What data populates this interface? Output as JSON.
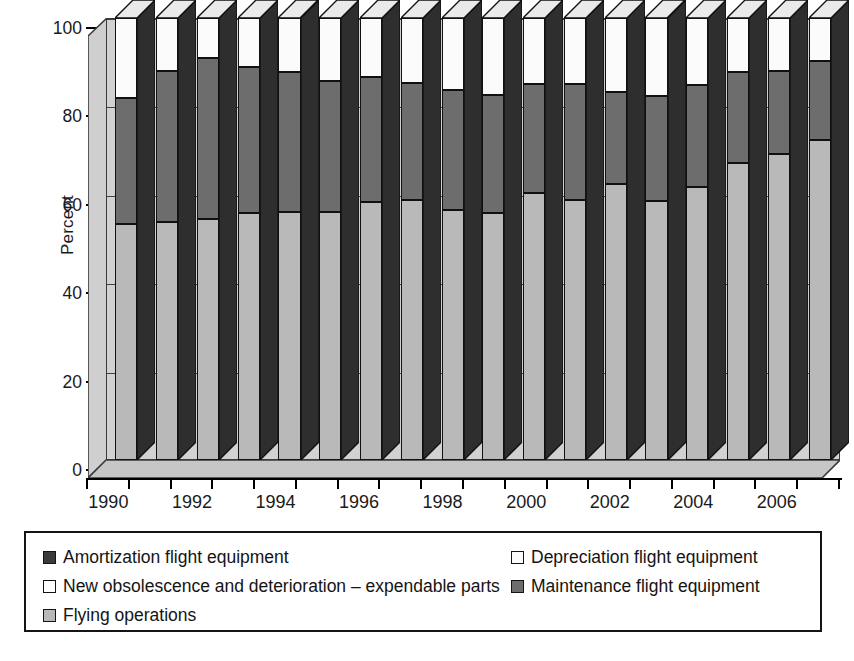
{
  "chart_data": {
    "type": "bar",
    "subtype": "stacked-100-percent-3d",
    "title": "",
    "xlabel": "",
    "ylabel": "Percent",
    "ylim": [
      0,
      100
    ],
    "yticks": [
      0,
      20,
      40,
      60,
      80,
      100
    ],
    "ytick_labels": [
      "0",
      "20",
      "40",
      "60",
      "80",
      "100"
    ],
    "grid": true,
    "grid_axis": "y",
    "legend_position": "below-plot",
    "categories": [
      "1990",
      "1991",
      "1992",
      "1993",
      "1994",
      "1995",
      "1996",
      "1997",
      "1998",
      "1999",
      "2000",
      "2001",
      "2002",
      "2003",
      "2004",
      "2005",
      "2006",
      "2007"
    ],
    "xtick_labels_shown": [
      "1990",
      "1992",
      "1994",
      "1996",
      "1998",
      "2000",
      "2002",
      "2004",
      "2006"
    ],
    "series": [
      {
        "name": "Flying operations",
        "color": "#b9b9b9",
        "values": [
          53.5,
          53.8,
          54.6,
          55.8,
          56.2,
          56.1,
          58.3,
          58.9,
          56.6,
          55.9,
          60.5,
          58.8,
          62.5,
          58.5,
          61.8,
          67.2,
          69.2,
          72.3
        ]
      },
      {
        "name": "Maintenance flight equipment",
        "color": "#6d6d6d",
        "values": [
          28.5,
          34.2,
          36.4,
          33.1,
          31.6,
          29.6,
          28.4,
          26.3,
          27.2,
          26.6,
          24.6,
          26.3,
          20.8,
          23.8,
          23.0,
          20.6,
          18.8,
          18.0
        ]
      },
      {
        "name": "Depreciation flight equipment",
        "color": "#fbfbfb",
        "values": [
          18.0,
          12.0,
          9.0,
          11.1,
          12.2,
          14.3,
          13.3,
          14.8,
          16.2,
          17.5,
          14.9,
          14.9,
          16.7,
          17.7,
          15.2,
          12.2,
          12.0,
          9.7
        ]
      },
      {
        "name": "Amortization flight equipment",
        "color": "#3a3a3a",
        "values": [
          0,
          0,
          0,
          0,
          0,
          0,
          0,
          0,
          0,
          0,
          0,
          0,
          0,
          0,
          0,
          0,
          0,
          0
        ]
      },
      {
        "name": "New obsolescence and deterioration – expendable parts",
        "color": "#ffffff",
        "values": [
          0,
          0,
          0,
          0,
          0,
          0,
          0,
          0,
          0,
          0,
          0,
          0,
          0,
          0,
          0,
          0,
          0,
          0
        ]
      }
    ]
  },
  "axis": {
    "ylabel": "Percent",
    "yticks": [
      "100",
      "80",
      "60",
      "40",
      "20",
      "0"
    ],
    "xticks": [
      "1990",
      "1992",
      "1994",
      "1996",
      "1998",
      "2000",
      "2002",
      "2004",
      "2006"
    ]
  },
  "legend": {
    "items": [
      {
        "label": "Amortization flight equipment",
        "swatch": "#3a3a3a",
        "column": 0,
        "row": 0
      },
      {
        "label": "Depreciation flight equipment",
        "swatch": "#fbfbfb",
        "column": 1,
        "row": 0
      },
      {
        "label": "New obsolescence and deterioration – expendable parts",
        "swatch": "#ffffff",
        "column": 0,
        "row": 1
      },
      {
        "label": "Maintenance flight equipment",
        "swatch": "#6d6d6d",
        "column": 1,
        "row": 1
      },
      {
        "label": "Flying operations",
        "swatch": "#b9b9b9",
        "column": 0,
        "row": 2
      }
    ]
  },
  "colors": {
    "flying_operations": "#b9b9b9",
    "maintenance": "#6d6d6d",
    "depreciation": "#fbfbfb",
    "amortization": "#3a3a3a",
    "new_obsolescence": "#ffffff",
    "plot_background": "#d2d2d2",
    "axis": "#000000"
  }
}
